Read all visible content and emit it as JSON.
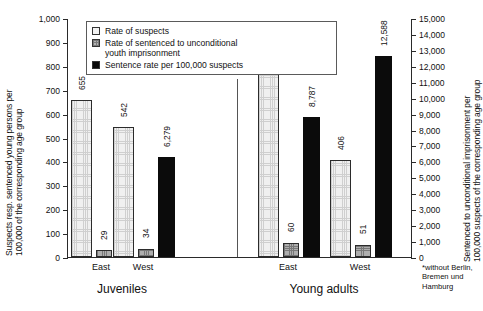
{
  "chart_data": {
    "type": "bar",
    "title": "",
    "subtitle": "",
    "categories": [
      "Juveniles East",
      "Juveniles West",
      "Young adults East",
      "Young adults West"
    ],
    "group_labels": [
      "Juveniles",
      "Young adults"
    ],
    "region_labels": [
      "East",
      "West",
      "East",
      "West"
    ],
    "series": [
      {
        "name": "Rate of suspects",
        "axis": "left",
        "values": [
          655,
          542,
          823,
          406
        ],
        "value_labels": [
          "655",
          "542",
          "823",
          "406"
        ],
        "color": "#f0f0f0",
        "pattern": "fine-dotted-grid"
      },
      {
        "name": "Rate of sentenced to unconditional youth imprisonment",
        "axis": "left",
        "values": [
          29,
          34,
          60,
          51
        ],
        "value_labels": [
          "29",
          "34",
          "60",
          "51"
        ],
        "color": "#aeaeae",
        "pattern": "gray-hatched"
      },
      {
        "name": "Sentence rate per 100,000 suspects",
        "axis": "right",
        "values": [
          5164,
          6279,
          8787,
          12588
        ],
        "value_labels": [
          "5,164",
          "6,279",
          "8,787",
          "12,588"
        ],
        "color": "#0b0b0b",
        "pattern": "solid-black"
      }
    ],
    "ylabel": "Suspects resp. sentenced young persons per 100,000 of the corresponding age group",
    "ylabel_line1": "Suspects resp. sentenced young persons per",
    "ylabel_line2": "100,000 of the corresponding age group",
    "ylim": [
      0,
      1000
    ],
    "ytick_labels": [
      "0",
      "100",
      "200",
      "300",
      "400",
      "500",
      "600",
      "700",
      "800",
      "900",
      "1,000"
    ],
    "y2label": "Sentenced to unconditional imprisonment per 100,000 suspects of the corresponding age group",
    "y2label_line1": "Sentenced to unconditional imprisonment per",
    "y2label_line2": "100,000 suspects of the corresponding age group",
    "y2lim": [
      0,
      15000
    ],
    "y2tick_labels": [
      "0",
      "1,000",
      "2,000",
      "3,000",
      "4,000",
      "5,000",
      "6,000",
      "7,000",
      "8,000",
      "9,000",
      "10,000",
      "11,000",
      "12,000",
      "13,000",
      "14,000",
      "15,000"
    ],
    "xlabel": "",
    "grid": false,
    "legend_position": "top-left",
    "legend_entries": [
      "Rate of suspects",
      "Rate of sentenced to unconditional youth imprisonment",
      "Sentence rate per 100,000 suspects"
    ],
    "legend_entry_2_line1": "Rate of sentenced to unconditional",
    "legend_entry_2_line2": "youth imprisonment",
    "annotations": {
      "footnote_line1": "*without Berlin,",
      "footnote_line2": "Bremen und",
      "footnote_line3": "Hamburg"
    }
  }
}
